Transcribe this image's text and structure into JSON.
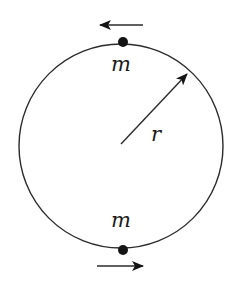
{
  "diagram": {
    "type": "circular-orbit",
    "colors": {
      "stroke": "#2b2b2b",
      "mass": "#141414",
      "background": "#ffffff"
    },
    "circle": {
      "center": [
        121,
        146
      ],
      "radius": 102
    },
    "masses": [
      {
        "id": "top",
        "label": "m",
        "position": [
          123,
          42
        ],
        "velocity_direction": "left"
      },
      {
        "id": "bottom",
        "label": "m",
        "position": [
          123,
          250
        ],
        "velocity_direction": "right"
      }
    ],
    "radius_arrow": {
      "label": "r",
      "from": [
        121,
        144
      ],
      "to": [
        187,
        74
      ]
    },
    "labels": {
      "mass_top": "m",
      "mass_bottom": "m",
      "radius": "r"
    }
  }
}
